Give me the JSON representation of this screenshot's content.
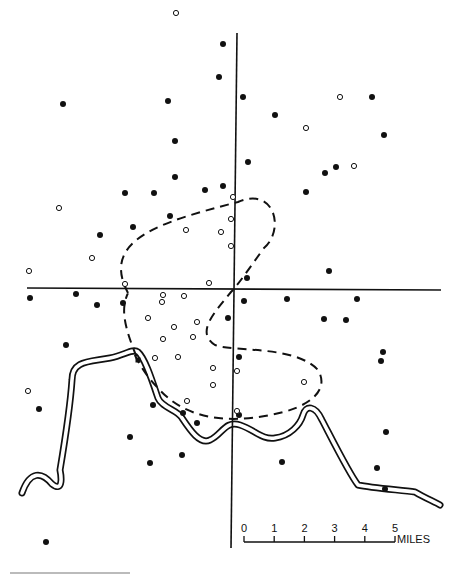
{
  "map": {
    "type": "point-distribution map with reference axes, dashed contour and river",
    "colors": {
      "ink": "#111111",
      "paper": "#ffffff"
    },
    "axes": {
      "vertical": {
        "x1": 237,
        "y1": 33,
        "x2": 231,
        "y2": 548
      },
      "horizontal": {
        "x1": 27,
        "y1": 288,
        "x2": 441,
        "y2": 290
      }
    },
    "filled_points": [
      [
        223,
        44
      ],
      [
        219,
        77
      ],
      [
        63,
        104
      ],
      [
        243,
        97
      ],
      [
        168,
        101
      ],
      [
        275,
        115
      ],
      [
        372,
        97
      ],
      [
        384,
        135
      ],
      [
        175,
        141
      ],
      [
        248,
        162
      ],
      [
        175,
        177
      ],
      [
        125,
        193
      ],
      [
        205,
        190
      ],
      [
        223,
        186
      ],
      [
        336,
        167
      ],
      [
        325,
        173
      ],
      [
        306,
        192
      ],
      [
        154,
        193
      ],
      [
        100,
        235
      ],
      [
        133,
        227
      ],
      [
        170,
        216
      ],
      [
        247,
        278
      ],
      [
        329,
        271
      ],
      [
        30,
        298
      ],
      [
        76,
        294
      ],
      [
        123,
        303
      ],
      [
        97,
        305
      ],
      [
        244,
        301
      ],
      [
        287,
        299
      ],
      [
        357,
        299
      ],
      [
        228,
        318
      ],
      [
        324,
        319
      ],
      [
        346,
        320
      ],
      [
        66,
        345
      ],
      [
        39,
        409
      ],
      [
        153,
        405
      ],
      [
        381,
        361
      ],
      [
        383,
        352
      ],
      [
        386,
        432
      ],
      [
        183,
        413
      ],
      [
        197,
        423
      ],
      [
        282,
        462
      ],
      [
        150,
        463
      ],
      [
        130,
        437
      ],
      [
        182,
        455
      ],
      [
        377,
        468
      ],
      [
        385,
        489
      ],
      [
        46,
        542
      ],
      [
        239,
        357
      ],
      [
        239,
        415
      ]
    ],
    "open_points": [
      [
        59,
        208
      ],
      [
        29,
        271
      ],
      [
        92,
        258
      ],
      [
        125,
        284
      ],
      [
        163,
        295
      ],
      [
        162,
        302
      ],
      [
        184,
        296
      ],
      [
        186,
        230
      ],
      [
        233,
        197
      ],
      [
        231,
        219
      ],
      [
        231,
        246
      ],
      [
        209,
        283
      ],
      [
        148,
        318
      ],
      [
        174,
        327
      ],
      [
        197,
        322
      ],
      [
        163,
        339
      ],
      [
        193,
        337
      ],
      [
        155,
        358
      ],
      [
        178,
        357
      ],
      [
        176,
        13
      ],
      [
        340,
        97
      ],
      [
        306,
        128
      ],
      [
        354,
        166
      ],
      [
        213,
        368
      ],
      [
        237,
        371
      ],
      [
        213,
        385
      ],
      [
        304,
        382
      ],
      [
        237,
        411
      ],
      [
        187,
        401
      ],
      [
        28,
        391
      ],
      [
        221,
        232
      ]
    ],
    "contour_path": "M 128 293 C 100 240, 160 222, 238 202 C 275 186, 285 230, 264 248 C 248 270, 238 285, 231 292 C 215 312, 195 332, 215 345 C 232 352, 295 345, 318 370 C 330 390, 310 408, 270 415 C 240 421, 190 425, 158 388 C 140 370, 130 345, 137 358 C 125 328, 120 310, 128 293",
    "river_path": "M 22 493 C 30 470, 42 472, 52 484 C 62 492, 62 480, 60 470 C 65 440, 70 410, 72 380 C 72 360, 90 362, 110 358 C 125 355, 133 348, 138 352 C 145 358, 152 380, 158 398 C 162 408, 178 410, 182 418 C 190 430, 200 445, 210 440 C 222 435, 225 420, 240 425 C 255 430, 262 440, 275 438 C 290 436, 300 425, 303 415 C 306 405, 315 405, 322 420 C 335 445, 350 475, 358 485 C 372 488, 400 490, 415 492 C 425 498, 435 502, 440 505",
    "marker_square": {
      "x": 138,
      "y": 360,
      "size": 5
    }
  },
  "scale_bar": {
    "ticks": [
      "0",
      "1",
      "2",
      "3",
      "4",
      "5"
    ],
    "unit_label": "MILES",
    "x_start": 244,
    "x_end": 395,
    "y": 542
  }
}
